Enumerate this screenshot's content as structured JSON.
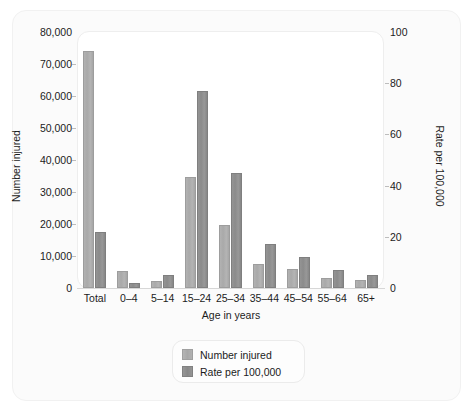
{
  "chart_data": {
    "type": "bar",
    "title": "",
    "subtitle": "",
    "xlabel": "Age in years",
    "ylabel": "Number injured",
    "y2label": "Rate per 100,000",
    "categories": [
      "Total",
      "0–4",
      "5–14",
      "15–24",
      "25–34",
      "35–44",
      "45–54",
      "55–64",
      "65+"
    ],
    "series": [
      {
        "name": "Number injured",
        "axis": "left",
        "color": "#a8a8a8",
        "values": [
          74000,
          5300,
          2100,
          34700,
          19700,
          7500,
          5800,
          3000,
          2400
        ]
      },
      {
        "name": "Rate per 100,000",
        "axis": "right",
        "color": "#8a8a8a",
        "values": [
          22,
          2,
          5,
          77,
          45,
          17,
          12,
          7,
          5
        ]
      }
    ],
    "ylim": [
      0,
      80000
    ],
    "y2lim": [
      0,
      100
    ],
    "yticks": [
      0,
      10000,
      20000,
      30000,
      40000,
      50000,
      60000,
      70000,
      80000
    ],
    "ytick_labels": [
      "0",
      "10,000",
      "20,000",
      "30,000",
      "40,000",
      "50,000",
      "60,000",
      "70,000",
      "80,000"
    ],
    "y2ticks": [
      0,
      20,
      40,
      60,
      80,
      100
    ],
    "y2tick_labels": [
      "0",
      "20",
      "40",
      "60",
      "80",
      "100"
    ],
    "grid": false,
    "legend_position": "below-center",
    "legend_entries": [
      "Number injured",
      "Rate per 100,000"
    ]
  },
  "axes": {
    "left_title": "Number injured",
    "right_title": "Rate per 100,000",
    "x_title": "Age in years"
  },
  "legend": {
    "items": [
      {
        "label": "Number injured"
      },
      {
        "label": "Rate per 100,000"
      }
    ]
  }
}
